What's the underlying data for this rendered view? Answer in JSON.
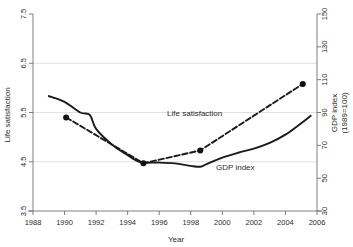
{
  "chart_data": {
    "type": "line",
    "title": "",
    "xlabel": "Year",
    "ylabel": "Life satisfaction",
    "y2label": "GDP index (1989=100)",
    "xlim": [
      1988,
      2006
    ],
    "xticks": [
      1988,
      1990,
      1992,
      1994,
      1996,
      1998,
      2000,
      2002,
      2004,
      2006
    ],
    "ylim": [
      3.5,
      7.5
    ],
    "yticks": [
      3.5,
      4.5,
      5.5,
      6.5,
      7.5
    ],
    "y2lim": [
      30,
      150
    ],
    "y2ticks": [
      30,
      50,
      70,
      90,
      110,
      130,
      150
    ],
    "grid": "horizontal",
    "legend_position": "inline-annotations",
    "series": [
      {
        "name": "Life satisfaction",
        "axis": "left",
        "style": "dashed",
        "markers": true,
        "color": "#1a1a1a",
        "x": [
          1990.1,
          1995.0,
          1998.6,
          2005.1
        ],
        "values": [
          5.4,
          4.47,
          4.73,
          6.08
        ]
      },
      {
        "name": "GDP index",
        "axis": "right",
        "style": "solid",
        "markers": false,
        "color": "#1a1a1a",
        "x": [
          1989.0,
          1990.0,
          1991.0,
          1991.6,
          1992.0,
          1993.0,
          1994.0,
          1994.5,
          1995.0,
          1996.0,
          1997.0,
          1998.0,
          1998.6,
          1999.0,
          2000.0,
          2001.0,
          2002.0,
          2003.0,
          2004.0,
          2005.0,
          2005.6
        ],
        "values": [
          100.0,
          96.5,
          90.0,
          88.5,
          80.0,
          70.5,
          64.0,
          61.0,
          59.5,
          59.5,
          59.0,
          57.5,
          57.0,
          58.5,
          62.5,
          65.5,
          68.0,
          71.5,
          76.5,
          83.5,
          88.0
        ]
      }
    ],
    "annotations": [
      {
        "text": "Life satisfaction",
        "x": 1996.5,
        "y": 5.43,
        "name": "life-satisfaction-label"
      },
      {
        "text": "GDP index",
        "x": 1999.6,
        "y": 4.33,
        "name": "gdp-index-label"
      }
    ]
  },
  "axes": {
    "x_title": "Year",
    "y_left_title": "Life satisfaction",
    "y_right_title_line1": "GDP index",
    "y_right_title_line2": "(1989=100)"
  },
  "colors": {
    "series": "#1a1a1a",
    "grid": "#d8d8d8",
    "frame": "#8a8a8a",
    "text": "#2b2b2b",
    "background": "#ffffff"
  }
}
